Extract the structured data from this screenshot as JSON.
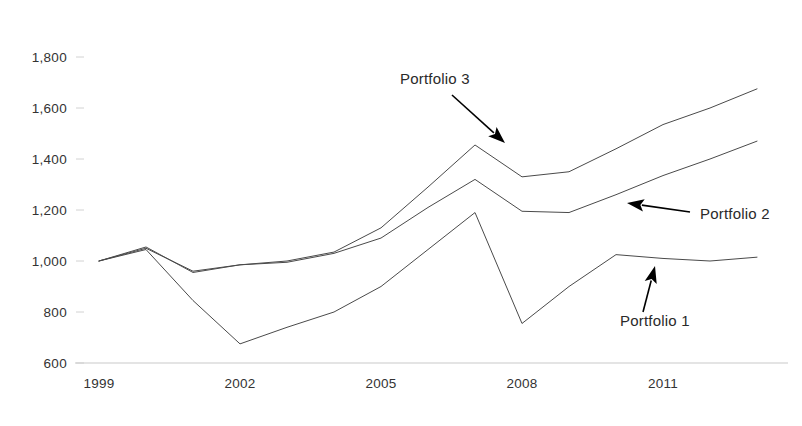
{
  "chart_data": {
    "type": "line",
    "title": "",
    "subtitle": "",
    "xlabel": "",
    "ylabel": "",
    "xlim": [
      1999,
      2013
    ],
    "ylim": [
      600,
      1800
    ],
    "grid": false,
    "legend_position": "inline-annotations",
    "y_ticks": [
      600,
      800,
      1000,
      1200,
      1400,
      1600,
      1800
    ],
    "y_tick_labels": [
      "600",
      "800",
      "1,000",
      "1,200",
      "1,400",
      "1,600",
      "1,800"
    ],
    "x_ticks": [
      1999,
      2002,
      2005,
      2008,
      2011
    ],
    "x_tick_labels": [
      "1999",
      "2002",
      "2005",
      "2008",
      "2011"
    ],
    "x": [
      1999,
      2000,
      2001,
      2002,
      2003,
      2004,
      2005,
      2006,
      2007,
      2008,
      2009,
      2010,
      2011,
      2012,
      2013
    ],
    "series": [
      {
        "name": "Portfolio 1",
        "values": [
          1000,
          1045,
          845,
          675,
          740,
          800,
          900,
          1045,
          1190,
          755,
          900,
          1025,
          1010,
          1000,
          1015
        ],
        "color": "#4a4a4a",
        "annotation": {
          "label": "Portfolio 1",
          "label_x": 620,
          "label_y": 326,
          "leader_from_x": 643,
          "leader_from_y": 312,
          "leader_to_x": 655,
          "leader_to_y": 266
        }
      },
      {
        "name": "Portfolio 2",
        "values": [
          1000,
          1050,
          960,
          985,
          995,
          1030,
          1090,
          1210,
          1320,
          1195,
          1190,
          1260,
          1335,
          1400,
          1470
        ],
        "color": "#4a4a4a",
        "annotation": {
          "label": "Portfolio 2",
          "label_x": 700,
          "label_y": 219,
          "leader_from_x": 690,
          "leader_from_y": 212,
          "leader_to_x": 627,
          "leader_to_y": 203
        }
      },
      {
        "name": "Portfolio 3",
        "values": [
          1000,
          1055,
          955,
          985,
          1000,
          1035,
          1130,
          1290,
          1455,
          1330,
          1350,
          1440,
          1535,
          1600,
          1675
        ],
        "color": "#4a4a4a",
        "annotation": {
          "label": "Portfolio 3",
          "label_x": 400,
          "label_y": 84,
          "leader_from_x": 452,
          "leader_from_y": 95,
          "leader_to_x": 505,
          "leader_to_y": 143
        }
      }
    ]
  },
  "axis": {
    "y_labels": [
      "1,800",
      "1,600",
      "1,400",
      "1,200",
      "1,000",
      "800",
      "600"
    ],
    "x_labels": [
      "1999",
      "2002",
      "2005",
      "2008",
      "2011"
    ]
  },
  "annotations": {
    "portfolio_3": "Portfolio 3",
    "portfolio_2": "Portfolio 2",
    "portfolio_1": "Portfolio 1"
  },
  "colors": {
    "line": "#4a4a4a",
    "text": "#333333",
    "annotation": "#000000",
    "baseline": "#c9c9c9",
    "background": "#ffffff"
  }
}
